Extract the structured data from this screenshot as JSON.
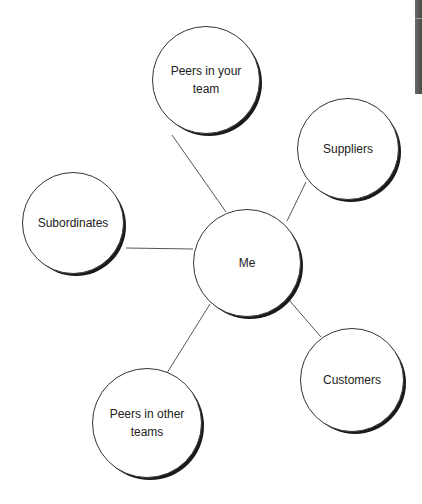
{
  "diagram": {
    "type": "hub-and-spoke",
    "center": {
      "id": "me",
      "label": "Me"
    },
    "nodes": [
      {
        "id": "peers-team",
        "label": "Peers in your team"
      },
      {
        "id": "suppliers",
        "label": "Suppliers"
      },
      {
        "id": "subordinates",
        "label": "Subordinates"
      },
      {
        "id": "customers",
        "label": "Customers"
      },
      {
        "id": "peers-other",
        "label": "Peers in other teams"
      }
    ],
    "edges": [
      [
        "me",
        "peers-team"
      ],
      [
        "me",
        "suppliers"
      ],
      [
        "me",
        "subordinates"
      ],
      [
        "me",
        "customers"
      ],
      [
        "me",
        "peers-other"
      ]
    ],
    "colors": {
      "line": "#555555",
      "circle_border": "#333333",
      "shadow": "#1a1a1a",
      "text": "#222222",
      "edge_bar": "#555555"
    }
  }
}
